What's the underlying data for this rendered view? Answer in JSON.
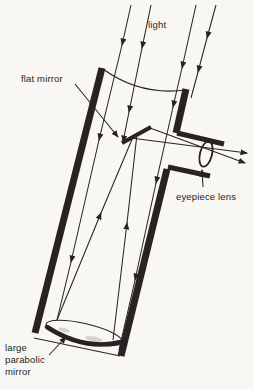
{
  "diagram": {
    "labels": {
      "light": "light",
      "flat_mirror": "flat mirror",
      "eyepiece_lens": "eyepiece lens",
      "parabolic_line1": "large",
      "parabolic_line2": "parabolic",
      "parabolic_line3": "mirror"
    },
    "colors": {
      "ink": "#282223",
      "background": "#f8f7f4"
    }
  }
}
